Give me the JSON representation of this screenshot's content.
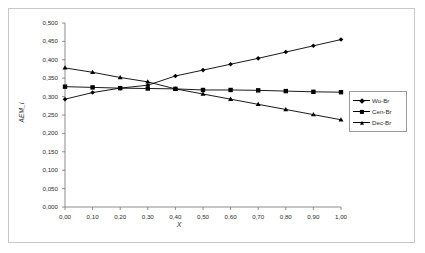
{
  "chart_data": {
    "type": "line",
    "title": "",
    "xlabel": "X",
    "ylabel": "AEM_i",
    "xlim": [
      0.0,
      1.0
    ],
    "ylim": [
      0.0,
      0.5
    ],
    "grid": false,
    "legend_position": "right",
    "x": [
      0.0,
      0.1,
      0.2,
      0.3,
      0.4,
      0.5,
      0.6,
      0.7,
      0.8,
      0.9,
      1.0
    ],
    "xticklabels": [
      "0,00",
      "0,10",
      "0,20",
      "0,30",
      "0,40",
      "0,50",
      "0,60",
      "0,70",
      "0,80",
      "0,90",
      "1,00"
    ],
    "yticks": [
      0.0,
      0.05,
      0.1,
      0.15,
      0.2,
      0.25,
      0.3,
      0.35,
      0.4,
      0.45,
      0.5
    ],
    "yticklabels": [
      "0,000",
      "0,050",
      "0,100",
      "0,150",
      "0,200",
      "0,250",
      "0,300",
      "0,350",
      "0,400",
      "0,450",
      "0,500"
    ],
    "series": [
      {
        "name": "Wo-Br",
        "marker": "diamond",
        "color": "#000000",
        "values": [
          0.293,
          0.311,
          0.323,
          0.331,
          0.356,
          0.372,
          0.388,
          0.404,
          0.421,
          0.438,
          0.455
        ]
      },
      {
        "name": "Cen-Br",
        "marker": "square",
        "color": "#000000",
        "values": [
          0.327,
          0.325,
          0.323,
          0.322,
          0.321,
          0.318,
          0.318,
          0.317,
          0.315,
          0.313,
          0.312
        ]
      },
      {
        "name": "Dec-Br",
        "marker": "triangle",
        "color": "#000000",
        "values": [
          0.378,
          0.366,
          0.352,
          0.34,
          0.321,
          0.307,
          0.293,
          0.279,
          0.265,
          0.251,
          0.237
        ]
      }
    ]
  },
  "legend": {
    "items": [
      {
        "label": "Wo-Br"
      },
      {
        "label": "Cen-Br"
      },
      {
        "label": "Dec-Br"
      }
    ]
  },
  "axes": {
    "x_title": "X",
    "y_title": "AEM_i"
  }
}
